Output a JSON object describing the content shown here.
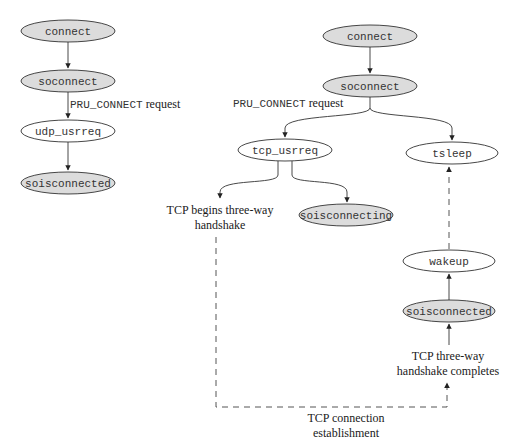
{
  "diagram": {
    "left_flow": {
      "nodes": [
        {
          "id": "l-connect",
          "label": "connect",
          "shaded": true
        },
        {
          "id": "l-soconnect",
          "label": "soconnect",
          "shaded": true
        },
        {
          "id": "l-udp_usrreq",
          "label": "udp_usrreq",
          "shaded": false
        },
        {
          "id": "l-soisconnected",
          "label": "soisconnected",
          "shaded": true
        }
      ],
      "edge_label": {
        "code": "PRU_CONNECT",
        "text": " request"
      }
    },
    "right_flow": {
      "nodes": [
        {
          "id": "r-connect",
          "label": "connect",
          "shaded": true
        },
        {
          "id": "r-soconnect",
          "label": "soconnect",
          "shaded": true
        },
        {
          "id": "r-tcp_usrreq",
          "label": "tcp_usrreq",
          "shaded": false
        },
        {
          "id": "r-tsleep",
          "label": "tsleep",
          "shaded": false
        },
        {
          "id": "r-soisconnecting",
          "label": "soisconnecting",
          "shaded": true
        },
        {
          "id": "r-wakeup",
          "label": "wakeup",
          "shaded": false
        },
        {
          "id": "r-soisconnected",
          "label": "soisconnected",
          "shaded": true
        }
      ],
      "edge_label": {
        "code": "PRU_CONNECT",
        "text": " request"
      },
      "annotations": {
        "begins_handshake": [
          "TCP begins three-way",
          "handshake"
        ],
        "handshake_completes": [
          "TCP three-way",
          "handshake completes"
        ],
        "connection_establishment": [
          "TCP connection",
          "establishment"
        ]
      }
    },
    "colors": {
      "shaded_fill": "#dcdcdc",
      "stroke": "#333333",
      "dashed": "#555555"
    }
  }
}
